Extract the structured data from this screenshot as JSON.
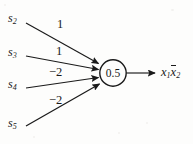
{
  "diagram": {
    "type": "threshold-gate",
    "node": {
      "threshold": "0.5",
      "shape": "circle"
    },
    "inputs": [
      {
        "name": "s2",
        "base": "s",
        "subscript": "2",
        "weight": "1"
      },
      {
        "name": "s3",
        "base": "s",
        "subscript": "3",
        "weight": "1"
      },
      {
        "name": "s4",
        "base": "s",
        "subscript": "4",
        "weight": "−2"
      },
      {
        "name": "s5",
        "base": "s",
        "subscript": "5",
        "weight": "−2"
      }
    ],
    "output": {
      "term1_base": "x",
      "term1_sub": "1",
      "term2_base": "x",
      "term2_sub": "2",
      "term2_overbar": true,
      "text": "x1x̅2"
    },
    "colors": {
      "ink": "#1a1a1a",
      "background": "#fdfdfc"
    }
  }
}
